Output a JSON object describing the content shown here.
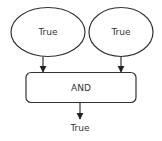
{
  "diagram": {
    "type": "logic-gate-flow",
    "colors": {
      "stroke": "#333333",
      "fill": "#ffffff",
      "text": "#333333"
    },
    "inputs": [
      {
        "id": "input-a",
        "label": "True"
      },
      {
        "id": "input-b",
        "label": "True"
      }
    ],
    "gate": {
      "id": "and-gate",
      "label": "AND"
    },
    "output": {
      "id": "output",
      "label": "True"
    },
    "edges": [
      {
        "from": "input-a",
        "to": "and-gate"
      },
      {
        "from": "input-b",
        "to": "and-gate"
      },
      {
        "from": "and-gate",
        "to": "output"
      }
    ]
  }
}
